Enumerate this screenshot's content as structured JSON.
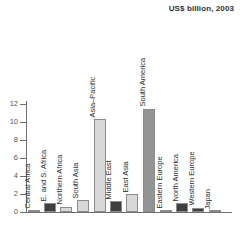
{
  "chart_data": {
    "type": "bar",
    "title": "US$ billion, 2003",
    "xlabel": "",
    "ylabel": "",
    "ylim": [
      0,
      12
    ],
    "ytick_labels": [
      "12",
      "10",
      "8",
      "6",
      "4",
      "2",
      "0"
    ],
    "ytick_values": [
      12,
      10,
      8,
      6,
      4,
      2,
      0
    ],
    "grid": false,
    "legend": "none",
    "categories": [
      "Central Africa",
      "E. and S. Africa",
      "Northern Africa",
      "South Asia",
      "Asia–Pacific",
      "Middle East",
      "East Asia",
      "South America",
      "Eastern Europe",
      "North America",
      "Western Europe",
      "Japan"
    ],
    "values": [
      0.2,
      1.0,
      0.6,
      1.3,
      10.3,
      1.2,
      2.0,
      11.5,
      0.15,
      1.0,
      0.5,
      0.05
    ],
    "bar_shades": [
      "medium",
      "dark",
      "light",
      "light",
      "light",
      "dark",
      "light",
      "medium",
      "medium",
      "dark",
      "dark",
      "light"
    ]
  },
  "colors": {
    "light": "#d8d8d8",
    "medium": "#949494",
    "dark": "#3f3f3f",
    "axis": "#6f6f6f",
    "bar_edge": "#8c8c8c",
    "text": "#333333",
    "background": "#ffffff"
  }
}
